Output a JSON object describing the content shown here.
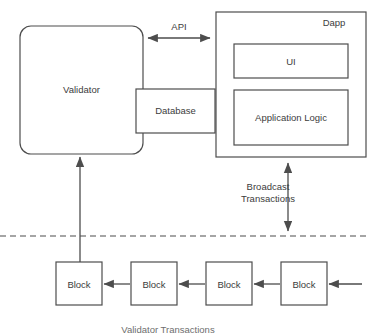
{
  "diagram": {
    "colors": {
      "stroke": "#4d4d4d",
      "text": "#3c3c3c",
      "background": "#ffffff"
    },
    "nodes": {
      "validator": {
        "label": "Validator",
        "shape": "rounded-rectangle"
      },
      "database": {
        "label": "Database",
        "shape": "rectangle"
      },
      "dapp": {
        "label": "Dapp",
        "shape": "rectangle"
      },
      "ui": {
        "label": "UI",
        "shape": "rectangle"
      },
      "application_logic": {
        "label": "Application Logic",
        "shape": "rectangle"
      }
    },
    "edges": {
      "api": {
        "label": "API",
        "style": "double-arrow"
      },
      "broadcast": {
        "label_line1": "Broadcast",
        "label_line2": "Transactions",
        "style": "double-arrow-vertical"
      },
      "validator_up": {
        "label": "",
        "style": "arrow-up"
      },
      "dapp_up": {
        "label": "",
        "style": "arrow-up"
      }
    },
    "divider": {
      "style": "dashed-horizontal"
    },
    "blocks": [
      {
        "label": "Block"
      },
      {
        "label": "Block"
      },
      {
        "label": "Block"
      },
      {
        "label": "Block"
      }
    ],
    "caption": "Validator Transactions"
  }
}
